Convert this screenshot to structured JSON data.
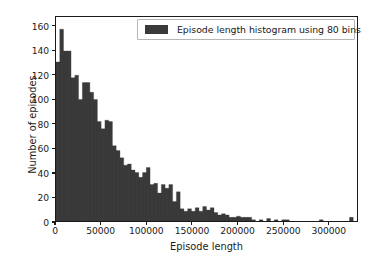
{
  "chart_data": {
    "type": "bar",
    "title": "",
    "subtitle": "",
    "xlabel": "Episode length",
    "ylabel": "Number of episodes",
    "xlim": [
      0,
      332000
    ],
    "ylim": [
      0,
      168
    ],
    "grid": false,
    "legend_position": "upper right",
    "bin_count": 80,
    "bin_width": 4150,
    "bar_color": "#3a3a3a",
    "axis_color": "#1a1a1a",
    "background_color": "#ffffff",
    "xticks": [
      0,
      50000,
      100000,
      150000,
      200000,
      250000,
      300000
    ],
    "xtick_labels": [
      "0",
      "50000",
      "100000",
      "150000",
      "200000",
      "250000",
      "300000"
    ],
    "yticks": [
      0,
      20,
      40,
      60,
      80,
      100,
      120,
      140,
      160
    ],
    "ytick_labels": [
      "0",
      "20",
      "40",
      "60",
      "80",
      "100",
      "120",
      "140",
      "160"
    ],
    "legend": [
      {
        "label": "Episode length histogram using 80 bins",
        "color": "#3a3a3a"
      }
    ],
    "series": [
      {
        "name": "Episode length histogram using 80 bins",
        "bin_edges": [
          0,
          4150,
          8300,
          12450,
          16600,
          20750,
          24900,
          29050,
          33200,
          37350,
          41500,
          45650,
          49800,
          53950,
          58100,
          62250,
          66400,
          70550,
          74700,
          78850,
          83000,
          87150,
          91300,
          95450,
          99600,
          103750,
          107900,
          112050,
          116200,
          120350,
          124500,
          128650,
          132800,
          136950,
          141100,
          145250,
          149400,
          153550,
          157700,
          161850,
          166000,
          170150,
          174300,
          178450,
          182600,
          186750,
          190900,
          195050,
          199200,
          203350,
          207500,
          211650,
          215800,
          219950,
          224100,
          228250,
          232400,
          236550,
          240700,
          244850,
          249000,
          253150,
          257300,
          261450,
          265600,
          269750,
          273900,
          278050,
          282200,
          286350,
          290500,
          294650,
          298800,
          302950,
          307100,
          311250,
          315400,
          319550,
          323700,
          327850,
          332000
        ],
        "values": [
          131,
          158,
          140,
          140,
          118,
          120,
          100,
          114,
          114,
          106,
          100,
          82,
          76,
          83,
          82,
          62,
          58,
          52,
          46,
          47,
          42,
          40,
          36,
          40,
          44,
          30,
          31,
          23,
          30,
          27,
          30,
          16,
          24,
          10,
          8,
          10,
          8,
          11,
          8,
          12,
          9,
          11,
          7,
          5,
          6,
          5,
          3,
          3,
          4,
          3,
          3,
          3,
          1,
          0,
          1,
          0,
          2,
          0,
          1,
          0,
          1,
          1,
          0,
          0,
          0,
          0,
          0,
          0,
          0,
          0,
          1,
          0,
          0,
          0,
          0,
          0,
          0,
          0,
          3,
          0
        ]
      }
    ]
  }
}
